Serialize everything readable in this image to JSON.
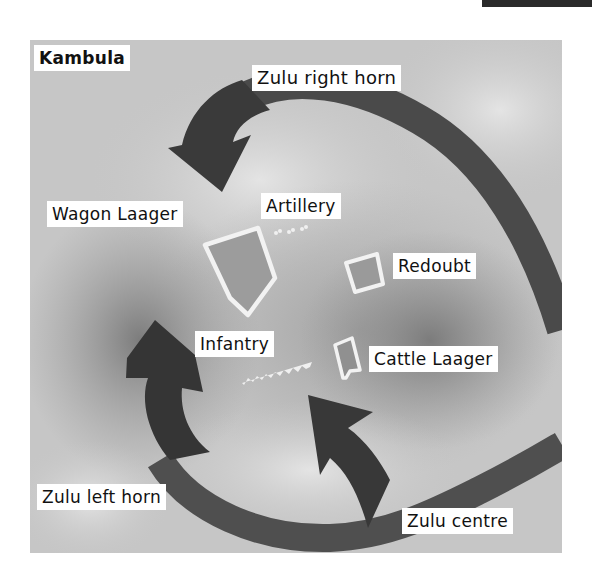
{
  "title": "Kambula",
  "labels": {
    "zulu_right_horn": "Zulu right horn",
    "wagon_laager": "Wagon Laager",
    "artillery": "Artillery",
    "redoubt": "Redoubt",
    "infantry": "Infantry",
    "cattle_laager": "Cattle Laager",
    "zulu_left_horn": "Zulu left horn",
    "zulu_centre": "Zulu centre"
  },
  "colors": {
    "terrain_base": "#c8c8c8",
    "terrain_light": "#e2e2e2",
    "terrain_dark": "#8e8e8e",
    "arrow": "#3e3e3e",
    "arrow_track": "#5a5a5a",
    "fortification": "#f2f2f2",
    "label_bg": "#ffffff",
    "label_text": "#111111"
  }
}
